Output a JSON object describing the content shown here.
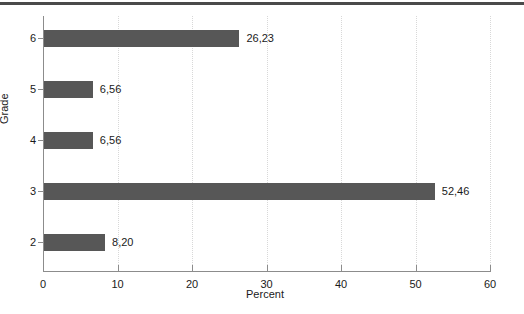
{
  "chart_data": {
    "type": "bar",
    "orientation": "horizontal",
    "title": "",
    "xlabel": "Percent",
    "ylabel": "Grade",
    "categories": [
      "2",
      "3",
      "4",
      "5",
      "6"
    ],
    "values": [
      8.2,
      52.46,
      6.56,
      6.56,
      26.23
    ],
    "value_labels": [
      "8,20",
      "52,46",
      "6,56",
      "6,56",
      "26,23"
    ],
    "xlim": [
      0,
      60
    ],
    "xticks": [
      0,
      10,
      20,
      30,
      40,
      50,
      60
    ],
    "xtick_labels": [
      "0",
      "10",
      "20",
      "30",
      "40",
      "50",
      "60"
    ],
    "grid": "vertical-dotted",
    "legend": "none",
    "bar_color": "#575757",
    "axis_color": "#8c8c8c",
    "gridline_color": "#d8d8d8",
    "background_color": "#ffffff",
    "bars": [
      {
        "category": "6",
        "value": 26.23,
        "label": "26,23"
      },
      {
        "category": "5",
        "value": 6.56,
        "label": "6,56"
      },
      {
        "category": "4",
        "value": 6.56,
        "label": "6,56"
      },
      {
        "category": "3",
        "value": 52.46,
        "label": "52,46"
      },
      {
        "category": "2",
        "value": 8.2,
        "label": "8,20"
      }
    ]
  }
}
